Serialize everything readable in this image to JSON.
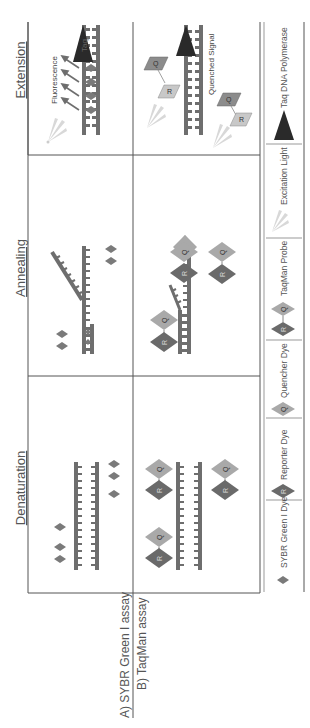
{
  "figure": {
    "orientation": "rotated-90-ccw",
    "phases": [
      {
        "key": "denaturation",
        "label": "Denaturation"
      },
      {
        "key": "annealing",
        "label": "Annealing"
      },
      {
        "key": "extension",
        "label": "Extension"
      }
    ],
    "assays": [
      {
        "key": "sybr",
        "label": "A) SYBR Green I assay"
      },
      {
        "key": "taqman",
        "label": "B) TaqMan assay"
      }
    ],
    "annotations": {
      "fluorescence": "Fluorescence",
      "quenched_signal": "Quenched Signal",
      "taq_short": "Taq",
      "reporter_letter": "R",
      "quencher_letter": "Q"
    },
    "legend": [
      {
        "key": "sybr_dye",
        "label": "SYBR Green I Dye"
      },
      {
        "key": "reporter_dye",
        "label": "Reporter Dye"
      },
      {
        "key": "quencher_dye",
        "label": "Quencher Dye"
      },
      {
        "key": "taqman_probe",
        "label": "TaqMan Probe"
      },
      {
        "key": "excitation_light",
        "label": "Excitation Light"
      },
      {
        "key": "taq_polymerase",
        "label": "Taq DNA Polymerase"
      }
    ],
    "colors": {
      "strand": "#6e6e6e",
      "sybr_dye": "#7a7a7a",
      "reporter": "#6a6a6a",
      "quencher": "#a9a9a9",
      "excitation": "#d8d8d8",
      "taq": "#2a2a2a",
      "grid": "#555555"
    }
  }
}
